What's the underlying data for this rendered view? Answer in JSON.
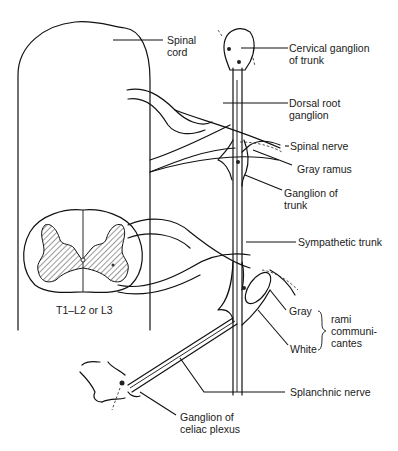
{
  "diagram": {
    "labels": {
      "spinal_cord": "Spinal\ncord",
      "cervical_ganglion": "Cervical ganglion\nof trunk",
      "dorsal_root_ganglion": "Dorsal root\nganglion",
      "spinal_nerve": "Spinal nerve",
      "gray_ramus": "Gray ramus",
      "ganglion_of_trunk": "Ganglion of\ntrunk",
      "sympathetic_trunk": "Sympathetic trunk",
      "segment": "T1–L2 or L3",
      "gray": "Gray",
      "white": "White",
      "rami_communicantes": "rami\ncommuni-\ncantes",
      "splanchnic_nerve": "Splanchnic nerve",
      "celiac_ganglion": "Ganglion of\nceliac plexus"
    },
    "colors": {
      "line": "#111111",
      "background": "#ffffff",
      "hatch": "#333333"
    }
  }
}
